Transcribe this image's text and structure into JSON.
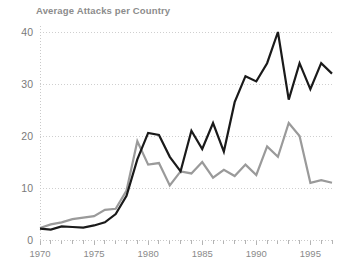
{
  "chart_data": {
    "type": "line",
    "title": "Average Attacks per Country",
    "xlabel": "",
    "ylabel": "",
    "xlim": [
      1970,
      1997
    ],
    "ylim": [
      0,
      43
    ],
    "yticks": [
      0,
      10,
      20,
      30,
      40
    ],
    "ytick_labels": [
      "0",
      "10",
      "20",
      "30",
      "40"
    ],
    "xticks": [
      1970,
      1975,
      1980,
      1985,
      1990,
      1995
    ],
    "xtick_labels": [
      "1970",
      "1975",
      "1980",
      "1985",
      "1990",
      "1995"
    ],
    "minor_xticks_every": 1,
    "grid": "horizontal-dotted",
    "legend": "none",
    "x": [
      1970,
      1971,
      1972,
      1973,
      1974,
      1975,
      1976,
      1977,
      1978,
      1979,
      1980,
      1981,
      1982,
      1983,
      1984,
      1985,
      1986,
      1987,
      1988,
      1989,
      1990,
      1991,
      1992,
      1993,
      1994,
      1995,
      1996,
      1997
    ],
    "series": [
      {
        "name": "dark-series",
        "color": "#1a1a1a",
        "width": 2.2,
        "values": [
          2.2,
          2.0,
          2.6,
          2.5,
          2.4,
          2.8,
          3.4,
          5.0,
          8.5,
          15.5,
          20.6,
          20.2,
          16.0,
          13.2,
          21.0,
          17.5,
          22.5,
          17.0,
          26.5,
          31.5,
          30.5,
          34.0,
          40.0,
          27.0,
          34.0,
          29.0,
          34.0,
          32.0
        ]
      },
      {
        "name": "gray-series",
        "color": "#9a9a9a",
        "width": 2.2,
        "values": [
          2.3,
          3.0,
          3.4,
          4.0,
          4.3,
          4.6,
          5.8,
          6.0,
          9.5,
          19.0,
          14.5,
          14.8,
          10.5,
          13.2,
          12.8,
          15.0,
          12.0,
          13.5,
          12.3,
          14.5,
          12.5,
          18.0,
          16.0,
          22.5,
          20.0,
          11.0,
          11.5,
          11.0
        ]
      }
    ]
  }
}
